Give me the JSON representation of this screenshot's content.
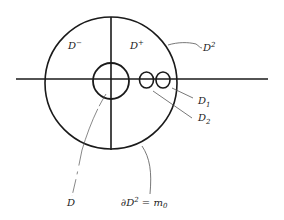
{
  "diagram": {
    "labels": {
      "d_minus": "D",
      "d_minus_sup": "−",
      "d_plus": "D",
      "d_plus_sup": "+",
      "d_squared": "D",
      "d_squared_sup": "2",
      "d1": "D",
      "d1_sub": "1",
      "d2": "D",
      "d2_sub": "2",
      "d": "D",
      "boundary_prefix": "∂D",
      "boundary_sup": "2",
      "boundary_suffix": " = m",
      "boundary_sub": "0"
    },
    "colors": {
      "stroke": "#1a1a1a",
      "leader": "#555555",
      "background": "#ffffff"
    }
  }
}
